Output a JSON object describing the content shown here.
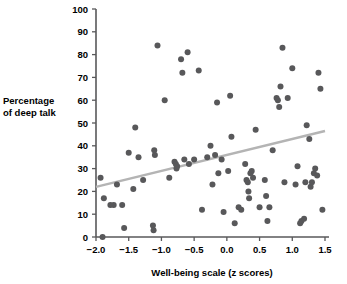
{
  "chart_data": {
    "type": "scatter",
    "title": "",
    "xlabel": "Well-being scale (z scores)",
    "xlabel_parts": {
      "pre": "Well-being scale (",
      "italic": "z",
      "post": " scores)"
    },
    "ylabel": "Percentage of deep talk",
    "ylabel_line1": "Percentage",
    "ylabel_line2": "of deep talk",
    "xlim": [
      -2.0,
      1.5
    ],
    "ylim": [
      0,
      100
    ],
    "xticks": [
      -2.0,
      -1.5,
      -1.0,
      -0.5,
      0.0,
      0.5,
      1.0,
      1.5
    ],
    "xtick_labels": [
      "−2.0",
      "−1.5",
      "−1.0",
      "−0.5",
      "0.0",
      "0.5",
      "1.0",
      "1.5"
    ],
    "yticks": [
      0,
      10,
      20,
      30,
      40,
      50,
      60,
      70,
      80,
      90,
      100
    ],
    "ytick_labels": [
      "0",
      "10",
      "20",
      "30",
      "40",
      "50",
      "60",
      "70",
      "80",
      "90",
      "100"
    ],
    "grid": false,
    "legend": false,
    "marker_color": "#58585a",
    "marker_size": 6,
    "trendline": {
      "type": "linear",
      "color": "#b4b4b4",
      "x_start": -2.0,
      "y_start": 22,
      "x_end": 1.5,
      "y_end": 46.5
    },
    "points": [
      [
        -1.93,
        26
      ],
      [
        -1.9,
        0
      ],
      [
        -1.88,
        17
      ],
      [
        -1.78,
        14
      ],
      [
        -1.73,
        14
      ],
      [
        -1.68,
        23
      ],
      [
        -1.6,
        14
      ],
      [
        -1.57,
        4
      ],
      [
        -1.5,
        37
      ],
      [
        -1.43,
        21
      ],
      [
        -1.4,
        48
      ],
      [
        -1.28,
        25
      ],
      [
        -1.13,
        5
      ],
      [
        -1.12,
        3
      ],
      [
        -1.11,
        38
      ],
      [
        -1.1,
        36
      ],
      [
        -1.06,
        84
      ],
      [
        -0.95,
        60
      ],
      [
        -0.88,
        26
      ],
      [
        -0.8,
        33
      ],
      [
        -0.78,
        32
      ],
      [
        -0.77,
        30
      ],
      [
        -0.76,
        31
      ],
      [
        -0.7,
        78
      ],
      [
        -0.68,
        72
      ],
      [
        -0.65,
        34
      ],
      [
        -0.6,
        81
      ],
      [
        -0.58,
        32
      ],
      [
        -0.43,
        73
      ],
      [
        -0.38,
        12
      ],
      [
        -0.25,
        40
      ],
      [
        -0.22,
        23
      ],
      [
        -0.18,
        36
      ],
      [
        -0.15,
        59
      ],
      [
        -0.13,
        28
      ],
      [
        -0.08,
        34
      ],
      [
        -0.05,
        11
      ],
      [
        0.02,
        29
      ],
      [
        0.05,
        62
      ],
      [
        0.07,
        44
      ],
      [
        0.12,
        6
      ],
      [
        0.18,
        13
      ],
      [
        0.28,
        32
      ],
      [
        0.3,
        25
      ],
      [
        0.32,
        24
      ],
      [
        0.33,
        20
      ],
      [
        0.34,
        17
      ],
      [
        0.36,
        28
      ],
      [
        0.38,
        29
      ],
      [
        0.4,
        26
      ],
      [
        0.44,
        47
      ],
      [
        0.5,
        13
      ],
      [
        0.58,
        25
      ],
      [
        0.6,
        18
      ],
      [
        0.62,
        7
      ],
      [
        0.7,
        38
      ],
      [
        0.76,
        61
      ],
      [
        0.78,
        60
      ],
      [
        0.8,
        57
      ],
      [
        0.82,
        66
      ],
      [
        0.85,
        83
      ],
      [
        0.93,
        61
      ],
      [
        1.0,
        74
      ],
      [
        1.08,
        31
      ],
      [
        1.12,
        6
      ],
      [
        1.14,
        7
      ],
      [
        1.18,
        8
      ],
      [
        1.2,
        24
      ],
      [
        1.22,
        49
      ],
      [
        1.26,
        43
      ],
      [
        1.28,
        22
      ],
      [
        1.3,
        24
      ],
      [
        1.33,
        28
      ],
      [
        1.35,
        30
      ],
      [
        1.38,
        27
      ],
      [
        1.4,
        72
      ],
      [
        1.43,
        65
      ],
      [
        1.46,
        12
      ],
      [
        -1.35,
        35
      ],
      [
        -0.3,
        35
      ],
      [
        0.22,
        12
      ],
      [
        0.65,
        13
      ],
      [
        0.88,
        24
      ],
      [
        1.05,
        23
      ],
      [
        -0.5,
        34
      ]
    ]
  }
}
